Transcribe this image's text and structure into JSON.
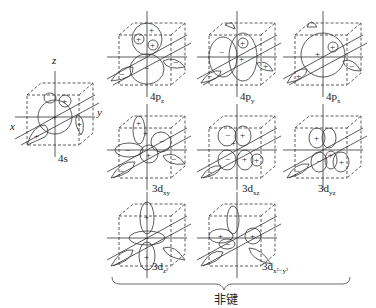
{
  "diagram": {
    "type": "orbital-diagram",
    "axes": {
      "x": "x",
      "y": "y",
      "z": "z"
    },
    "orbitals": [
      {
        "id": "4s",
        "label_main": "4s",
        "label_sub": ""
      },
      {
        "id": "4pz",
        "label_main": "4p",
        "label_sub": "z"
      },
      {
        "id": "4py",
        "label_main": "4p",
        "label_sub": "y"
      },
      {
        "id": "4px",
        "label_main": "4p",
        "label_sub": "x"
      },
      {
        "id": "3dxy",
        "label_main": "3d",
        "label_sub": "xy"
      },
      {
        "id": "3dxz",
        "label_main": "3d",
        "label_sub": "xz"
      },
      {
        "id": "3dyz",
        "label_main": "3d",
        "label_sub": "yz"
      },
      {
        "id": "3dz2",
        "label_main": "3d",
        "label_sub": "z²"
      },
      {
        "id": "3dx2y2",
        "label_main": "3d",
        "label_sub": "x²−y²"
      }
    ],
    "signs": {
      "plus": "+",
      "minus": "−"
    },
    "group_label": "非键"
  }
}
